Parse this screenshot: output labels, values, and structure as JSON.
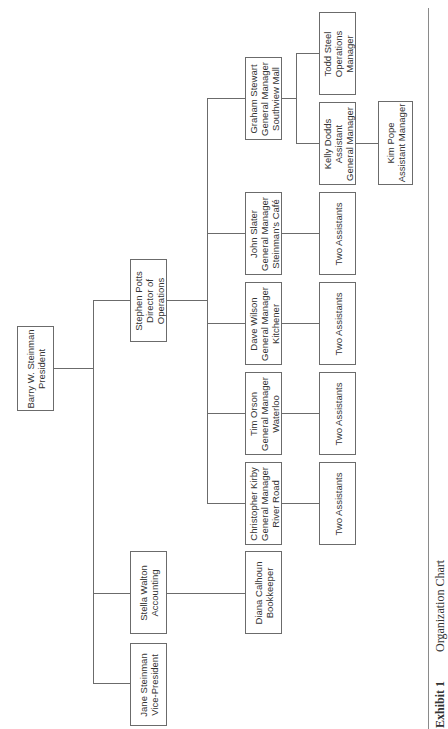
{
  "caption": {
    "exhibit": "Exhibit 1",
    "title": "Organization Chart"
  },
  "nodes": {
    "barry": {
      "name": "Barry W. Steinman",
      "title": "President"
    },
    "stephen": {
      "name": "Stephen Potts",
      "title": "Director of",
      "title2": "Operations"
    },
    "stella": {
      "name": "Stella Walton",
      "title": "Accounting"
    },
    "jane": {
      "name": "Jane Steinman",
      "title": "Vice-President"
    },
    "diana": {
      "name": "Diana Calhoun",
      "title": "Bookkeeper"
    },
    "graham": {
      "name": "Graham Stewart",
      "title": "General Manager",
      "location": "Southview Mall"
    },
    "john": {
      "name": "John Slater",
      "title": "General Manager",
      "location": "Steinman's Café"
    },
    "dave": {
      "name": "Dave Wilson",
      "title": "General Manager",
      "location": "Kitchener"
    },
    "tim": {
      "name": "Tim Orson",
      "title": "General Manager",
      "location": "Waterloo"
    },
    "christopher": {
      "name": "Christopher Kirby",
      "title": "General Manager",
      "location": "River Road"
    },
    "todd": {
      "name": "Todd Steel",
      "title": "Operations",
      "title2": "Manager"
    },
    "kelly": {
      "name": "Kelly Dodds",
      "title": "Assistant",
      "title2": "General Manager"
    },
    "kim": {
      "name": "Kim Pope",
      "title": "Assistant Manager"
    },
    "assist_john": {
      "name": "Two Assistants"
    },
    "assist_dave": {
      "name": "Two Assistants"
    },
    "assist_tim": {
      "name": "Two Assistants"
    },
    "assist_christopher": {
      "name": "Two Assistants"
    }
  }
}
